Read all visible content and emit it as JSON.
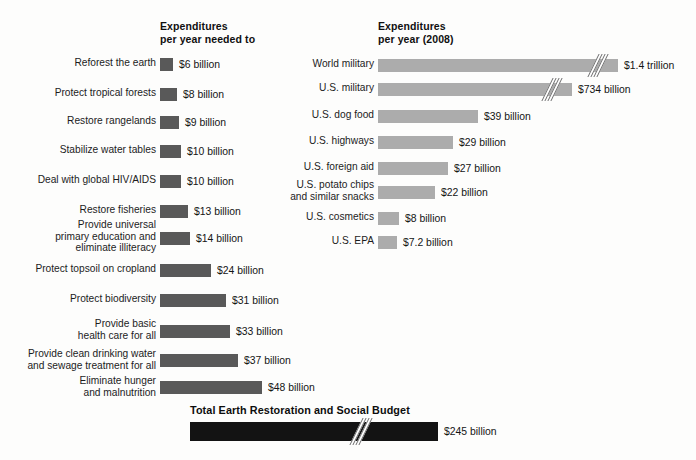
{
  "headings": {
    "left": "Expenditures\nper year needed to",
    "right": "Expenditures\nper year (2008)"
  },
  "total": {
    "heading": "Total Earth Restoration and Social Budget",
    "value_label": "$245 billion"
  },
  "caption": {
    "text": ""
  },
  "colors": {
    "left_bar": "#595959",
    "right_bar": "#acacac",
    "total_bar": "#131313",
    "background": "#fdfdfc",
    "text": "#1a1a1a"
  },
  "chart_data": {
    "type": "bar",
    "title": "Total Earth Restoration and Social Budget",
    "orientation": "horizontal",
    "grid": false,
    "legend": false,
    "units": "USD billions per year",
    "series": [
      {
        "name": "Expenditures per year needed to",
        "axis_heading": "Expenditures\nper year needed to",
        "color": "#595959",
        "px_per_billion": 2.12,
        "categories": [
          "Reforest the earth",
          "Protect tropical forests",
          "Restore rangelands",
          "Stabilize water tables",
          "Deal with global HIV/AIDS",
          "Restore fisheries",
          "Provide universal\nprimary education and\neliminate illiteracy",
          "Protect topsoil on cropland",
          "Protect biodiversity",
          "Provide basic\nhealth care for all",
          "Provide clean drinking water\nand sewage treatment for all",
          "Eliminate hunger\nand malnutrition"
        ],
        "values": [
          6,
          8,
          9,
          10,
          10,
          13,
          14,
          24,
          31,
          33,
          37,
          48
        ],
        "value_labels": [
          "$6 billion",
          "$8 billion",
          "$9 billion",
          "$10 billion",
          "$10 billion",
          "$13 billion",
          "$14 billion",
          "$24 billion",
          "$31 billion",
          "$33 billion",
          "$37 billion",
          "$48 billion"
        ]
      },
      {
        "name": "Expenditures per year (2008)",
        "axis_heading": "Expenditures\nper year (2008)",
        "color": "#acacac",
        "px_per_billion": 2.57,
        "categories": [
          "World military",
          "U.S. military",
          "U.S. dog food",
          "U.S. highways",
          "U.S. foreign aid",
          "U.S. potato chips\nand similar snacks",
          "U.S. cosmetics",
          "U.S. EPA"
        ],
        "values": [
          1400,
          734,
          39,
          29,
          27,
          22,
          8,
          7.2
        ],
        "value_labels": [
          "$1.4 trillion",
          "$734 billion",
          "$39 billion",
          "$29 billion",
          "$27 billion",
          "$22 billion",
          "$8 billion",
          "$7.2 billion"
        ],
        "axis_broken": [
          true,
          true,
          false,
          false,
          false,
          false,
          false,
          false
        ]
      }
    ],
    "total": {
      "label": "Total Earth Restoration and Social Budget",
      "value": 245,
      "value_label": "$245 billion",
      "color": "#131313",
      "axis_broken": true
    }
  }
}
